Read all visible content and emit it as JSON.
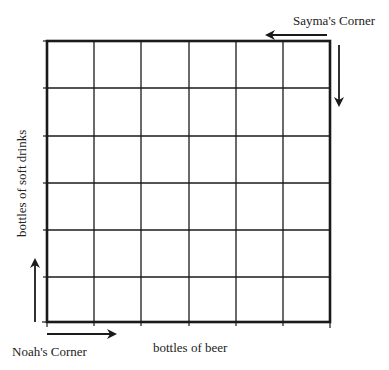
{
  "diagram": {
    "type": "grid",
    "rows": 6,
    "columns": 6,
    "line_color": "#1a1a1a",
    "corners": {
      "top_right": {
        "label": "Sayma's Corner",
        "arrows": [
          "left",
          "down"
        ]
      },
      "bottom_left": {
        "label": "Noah's Corner",
        "arrows": [
          "up",
          "right"
        ]
      }
    },
    "axes": {
      "x_label": "bottles of beer",
      "y_label": "bottles of soft drinks"
    }
  }
}
